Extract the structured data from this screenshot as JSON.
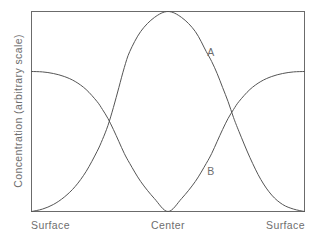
{
  "chart_data": {
    "type": "line",
    "title": "",
    "subtitle": "",
    "xlabel": "",
    "ylabel": "Concentration (arbitrary scale)",
    "grid": false,
    "legend_position": "inline-annotation",
    "xlim": [
      0,
      1
    ],
    "ylim": [
      0,
      1
    ],
    "x_tick_labels": [
      "Surface",
      "Center",
      "Surface"
    ],
    "x_tick_positions": [
      0,
      0.5,
      1
    ],
    "y_tick_labels": [],
    "axis_frame": "box",
    "annotations": [
      {
        "label": "A",
        "x": 0.72,
        "y": 0.78,
        "series": "A"
      },
      {
        "label": "B",
        "x": 0.72,
        "y": 0.215,
        "series": "B"
      }
    ],
    "series": [
      {
        "name": "A",
        "label": "A",
        "color": "#555555",
        "description": "Low at both surfaces, rises steeply to a broad maximum at the center",
        "x": [
          0,
          0.04,
          0.08,
          0.12,
          0.16,
          0.2,
          0.24,
          0.26,
          0.28,
          0.3,
          0.32,
          0.34,
          0.36,
          0.4,
          0.45,
          0.5,
          0.55,
          0.6,
          0.64,
          0.66,
          0.68,
          0.7,
          0.72,
          0.74,
          0.76,
          0.8,
          0.84,
          0.88,
          0.92,
          0.96,
          1.0
        ],
        "values": [
          0.0,
          0.012,
          0.035,
          0.072,
          0.125,
          0.2,
          0.3,
          0.36,
          0.43,
          0.52,
          0.62,
          0.72,
          0.8,
          0.9,
          0.97,
          1.0,
          0.97,
          0.9,
          0.8,
          0.75,
          0.69,
          0.62,
          0.55,
          0.47,
          0.4,
          0.27,
          0.16,
          0.082,
          0.035,
          0.012,
          0.0
        ]
      },
      {
        "name": "B",
        "label": "B",
        "color": "#555555",
        "description": "Plateau near 0.70 at both surfaces, falls to zero at the center",
        "x": [
          0,
          0.04,
          0.08,
          0.12,
          0.16,
          0.2,
          0.24,
          0.26,
          0.28,
          0.3,
          0.32,
          0.34,
          0.36,
          0.4,
          0.45,
          0.5,
          0.55,
          0.6,
          0.64,
          0.66,
          0.68,
          0.7,
          0.72,
          0.74,
          0.76,
          0.8,
          0.84,
          0.88,
          0.92,
          0.96,
          1.0
        ],
        "values": [
          0.7,
          0.698,
          0.69,
          0.675,
          0.65,
          0.61,
          0.55,
          0.51,
          0.465,
          0.41,
          0.35,
          0.29,
          0.24,
          0.15,
          0.065,
          0.0,
          0.065,
          0.15,
          0.24,
          0.29,
          0.35,
          0.41,
          0.465,
          0.51,
          0.55,
          0.61,
          0.65,
          0.675,
          0.69,
          0.698,
          0.7
        ]
      }
    ],
    "crossings": [
      {
        "x": 0.3,
        "y": 0.465
      },
      {
        "x": 0.7,
        "y": 0.465
      }
    ],
    "colors": {
      "line": "#555555",
      "frame": "#6b6b6b",
      "text": "#6e6e6e",
      "background": "#ffffff"
    }
  },
  "axes": {
    "y_label": "Concentration (arbitrary scale)",
    "x_tick_left": "Surface",
    "x_tick_center": "Center",
    "x_tick_right": "Surface"
  },
  "curve_labels": {
    "a": "A",
    "b": "B"
  }
}
